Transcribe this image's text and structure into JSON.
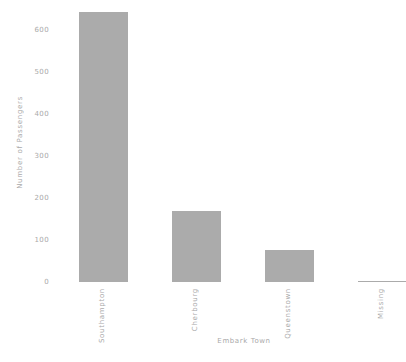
{
  "chart_data": {
    "type": "bar",
    "categories": [
      "Southampton",
      "Cherbourg",
      "Queenstown",
      "Missing"
    ],
    "values": [
      644,
      168,
      77,
      2
    ],
    "title": "",
    "xlabel": "Embark Town",
    "ylabel": "Number of Passengers",
    "ylim": [
      0,
      677
    ],
    "yticks": [
      0,
      100,
      200,
      300,
      400,
      500,
      600
    ],
    "grid": "off",
    "legend": "none",
    "bar_color": "#ababab",
    "text_color": "#a9a9a9",
    "background_color": "#ffffff"
  }
}
